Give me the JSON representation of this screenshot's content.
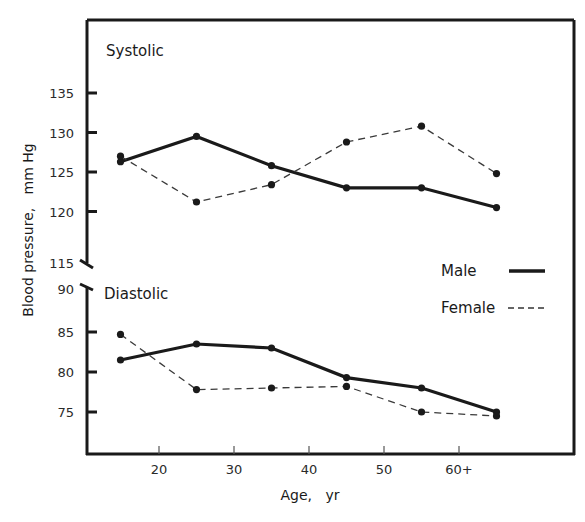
{
  "chart_data": {
    "type": "line",
    "title": "",
    "xlabel": "Age,   yr",
    "ylabel": "Blood pressure,   mm Hg",
    "x_ticks": [
      "20",
      "30",
      "40",
      "50",
      "60+"
    ],
    "x": [
      15,
      25,
      35,
      45,
      55,
      65
    ],
    "legend": {
      "position": "right-middle",
      "entries": [
        {
          "name": "Male",
          "style": "solid-thick"
        },
        {
          "name": "Female",
          "style": "dashed"
        }
      ]
    },
    "grid": false,
    "panels": [
      {
        "label": "Systolic",
        "ylim": [
          115,
          140
        ],
        "y_ticks": [
          "135",
          "130",
          "125",
          "120",
          "115"
        ],
        "series": [
          {
            "name": "Male",
            "values": [
              126.3,
              129.5,
              125.8,
              123.0,
              123.0,
              120.5
            ]
          },
          {
            "name": "Female",
            "values": [
              127.0,
              121.2,
              123.4,
              128.8,
              130.8,
              124.8
            ]
          }
        ]
      },
      {
        "label": "Diastolic",
        "ylim": [
          70,
          90
        ],
        "y_ticks": [
          "90",
          "85",
          "80",
          "75"
        ],
        "series": [
          {
            "name": "Male",
            "values": [
              81.5,
              83.5,
              83.0,
              79.3,
              78.0,
              75.0
            ]
          },
          {
            "name": "Female",
            "values": [
              84.7,
              77.8,
              78.0,
              78.2,
              75.0,
              74.5
            ]
          }
        ]
      }
    ]
  },
  "colors": {
    "line": "#1a1a1a",
    "background": "#ffffff"
  }
}
